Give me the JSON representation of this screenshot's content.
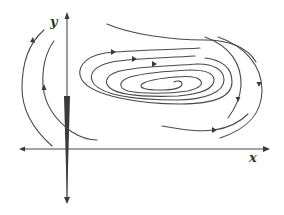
{
  "diagram": {
    "type": "phase-portrait",
    "axes": {
      "x_label": "x",
      "y_label": "y"
    },
    "colors": {
      "stroke": "#4a4a4a",
      "background": "#ffffff"
    },
    "trajectories": [
      {
        "name": "left-outer",
        "direction": "upward"
      },
      {
        "name": "left-inner",
        "direction": "upward"
      },
      {
        "name": "spiral-center",
        "direction": "clockwise-inward"
      },
      {
        "name": "upper-arc",
        "direction": "rightward"
      },
      {
        "name": "right-outer",
        "direction": "downward"
      },
      {
        "name": "right-inner",
        "direction": "downward"
      },
      {
        "name": "bottom-right",
        "direction": "rightward"
      }
    ]
  }
}
